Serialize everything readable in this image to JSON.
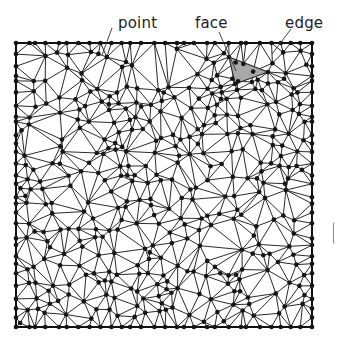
{
  "labels": {
    "point": "point",
    "face": "face",
    "edge": "edge"
  },
  "colors": {
    "edge": "#2a2a2a",
    "point": "#151515",
    "face_fill": "#a8a8a8",
    "border": "#111111"
  },
  "mesh": {
    "bounds": {
      "x0": 16,
      "y0": 43,
      "x1": 312,
      "y1": 327
    },
    "interior_points": 360,
    "seed": 20231,
    "highlighted_face": [
      [
        229,
        57
      ],
      [
        268,
        72
      ],
      [
        235,
        84
      ]
    ]
  },
  "leaders": {
    "point": {
      "from": [
        112,
        28
      ],
      "to": [
        102,
        55
      ]
    },
    "face": {
      "from": [
        219,
        32
      ],
      "to": [
        236,
        71
      ]
    },
    "edge": {
      "from": [
        291,
        29
      ],
      "to": [
        272,
        54
      ]
    }
  }
}
